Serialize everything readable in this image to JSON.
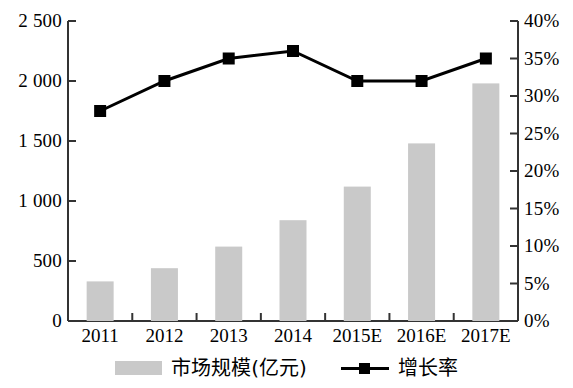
{
  "chart_data": {
    "type": "bar",
    "title": "",
    "subtitle": "",
    "xlabel": "",
    "ylabel": "",
    "y2label": "",
    "grid": false,
    "legend_position": "bottom",
    "categories": [
      "2011",
      "2012",
      "2013",
      "2014",
      "2015E",
      "2016E",
      "2017E"
    ],
    "series": [
      {
        "name": "市场规模(亿元)",
        "type": "bar",
        "axis": "left",
        "color": "#c9c9c9",
        "values": [
          330,
          440,
          620,
          840,
          1120,
          1480,
          1980
        ]
      },
      {
        "name": "增长率",
        "type": "line",
        "axis": "right",
        "color": "#000000",
        "values": [
          28,
          32,
          35,
          36,
          32,
          32,
          35
        ]
      }
    ],
    "ylim": [
      0,
      2500
    ],
    "yticks": [
      0,
      500,
      1000,
      1500,
      2000,
      2500
    ],
    "ytick_labels": [
      "0",
      "500",
      "1 000",
      "1 500",
      "2 000",
      "2 500"
    ],
    "y2lim": [
      0,
      40
    ],
    "y2ticks": [
      0,
      5,
      10,
      15,
      20,
      25,
      30,
      35,
      40
    ],
    "y2tick_labels": [
      "0%",
      "5%",
      "10%",
      "15%",
      "20%",
      "25%",
      "30%",
      "35%",
      "40%"
    ]
  },
  "legend": {
    "items": [
      {
        "label": "市场规模(亿元)",
        "marker": "bar-swatch"
      },
      {
        "label": "增长率",
        "marker": "line-square-marker"
      }
    ]
  }
}
